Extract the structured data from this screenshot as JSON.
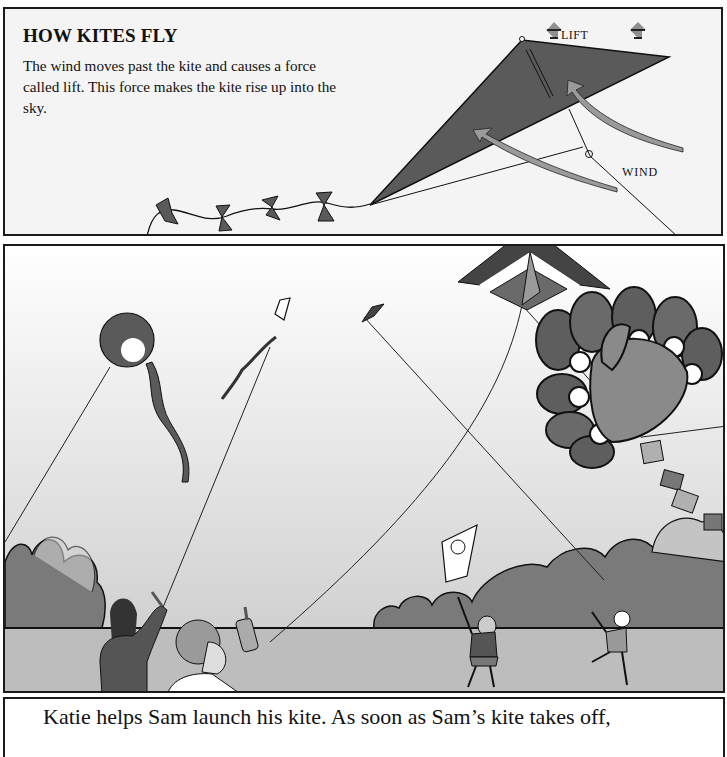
{
  "top_panel": {
    "heading": "HOW KITES FLY",
    "body": "The wind moves past the kite and causes a force called lift. This force makes the kite rise up into the sky.",
    "labels": {
      "lift": "LIFT",
      "wind": "WIND"
    },
    "icons": [
      "lift-arrow-icon",
      "lift-arrow-icon",
      "wind-arrow-icon",
      "wind-arrow-icon",
      "bow-tail-icon"
    ]
  },
  "middle_panel": {
    "scene": "Children flying kites in a park",
    "kites": [
      "round-face-kite",
      "small-diamond-kite",
      "small-dark-kite",
      "box-chevron-kite",
      "turkey-kite",
      "cat-face-kite"
    ],
    "people": [
      "Katie",
      "Sam",
      "girl-with-cat-kite",
      "running-boy"
    ]
  },
  "bottom_panel": {
    "caption": "Katie helps Sam launch his kite. As soon as Sam’s kite takes off,"
  },
  "colors": {
    "kite_dark": "#5a5a5a",
    "arrow_gray": "#8f8f8f",
    "bush": "#7a7a7a",
    "ground": "#bdbdbd",
    "border": "#1a1a1a"
  }
}
